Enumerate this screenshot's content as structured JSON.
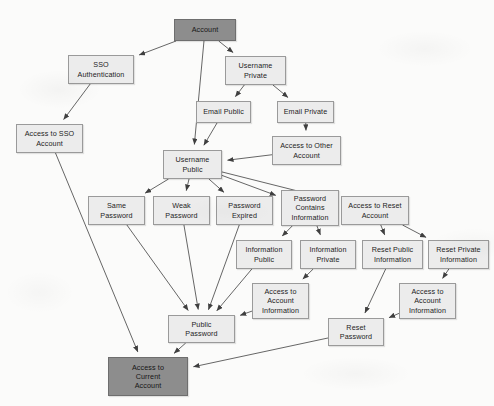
{
  "diagram": {
    "type": "attack-tree",
    "background_color": "#fbfbfa",
    "node_fill_light": "#ececec",
    "node_fill_dark": "#8d8d8d",
    "node_border_color": "#9a9a9a",
    "edge_color": "#4a4a4a",
    "nodes": [
      {
        "id": "account",
        "label": "Account",
        "shade": "dark",
        "x": 174,
        "y": 19,
        "w": 62,
        "h": 22
      },
      {
        "id": "sso_auth",
        "label": "SSO\nAuthentication",
        "shade": "light",
        "x": 68,
        "y": 55,
        "w": 66,
        "h": 29
      },
      {
        "id": "username_private",
        "label": "Username\nPrivate",
        "shade": "light",
        "x": 225,
        "y": 56,
        "w": 61,
        "h": 29
      },
      {
        "id": "email_public",
        "label": "Email Public",
        "shade": "light",
        "x": 196,
        "y": 101,
        "w": 55,
        "h": 22
      },
      {
        "id": "email_private",
        "label": "Email Private",
        "shade": "light",
        "x": 277,
        "y": 101,
        "w": 57,
        "h": 22
      },
      {
        "id": "access_sso",
        "label": "Access to SSO\nAccount",
        "shade": "light",
        "x": 16,
        "y": 124,
        "w": 67,
        "h": 29
      },
      {
        "id": "access_other",
        "label": "Access to Other\nAccount",
        "shade": "light",
        "x": 272,
        "y": 136,
        "w": 69,
        "h": 29
      },
      {
        "id": "username_public",
        "label": "Username\nPublic",
        "shade": "light",
        "x": 163,
        "y": 150,
        "w": 59,
        "h": 29
      },
      {
        "id": "same_password",
        "label": "Same\nPassword",
        "shade": "light",
        "x": 88,
        "y": 196,
        "w": 57,
        "h": 29
      },
      {
        "id": "weak_password",
        "label": "Weak\nPassword",
        "shade": "light",
        "x": 153,
        "y": 196,
        "w": 57,
        "h": 29
      },
      {
        "id": "password_expired",
        "label": "Password\nExpired",
        "shade": "light",
        "x": 216,
        "y": 196,
        "w": 57,
        "h": 29
      },
      {
        "id": "pwd_contains",
        "label": "Password\nContains\nInformation",
        "shade": "light",
        "x": 281,
        "y": 190,
        "w": 58,
        "h": 36
      },
      {
        "id": "access_reset",
        "label": "Access to Reset\nAccount",
        "shade": "light",
        "x": 341,
        "y": 196,
        "w": 68,
        "h": 29
      },
      {
        "id": "info_public",
        "label": "Information\nPublic",
        "shade": "light",
        "x": 236,
        "y": 240,
        "w": 56,
        "h": 29
      },
      {
        "id": "info_private",
        "label": "Information\nPrivate",
        "shade": "light",
        "x": 300,
        "y": 240,
        "w": 56,
        "h": 29
      },
      {
        "id": "reset_public",
        "label": "Reset Public\nInformation",
        "shade": "light",
        "x": 362,
        "y": 240,
        "w": 61,
        "h": 29
      },
      {
        "id": "reset_private",
        "label": "Reset Private\nInformation",
        "shade": "light",
        "x": 428,
        "y": 240,
        "w": 61,
        "h": 29
      },
      {
        "id": "access_acct_1",
        "label": "Access to\nAccount\nInformation",
        "shade": "light",
        "x": 252,
        "y": 283,
        "w": 57,
        "h": 36
      },
      {
        "id": "access_acct_2",
        "label": "Access to\nAccount\nInformation",
        "shade": "light",
        "x": 399,
        "y": 283,
        "w": 57,
        "h": 36
      },
      {
        "id": "public_password",
        "label": "Public\nPassword",
        "shade": "light",
        "x": 168,
        "y": 315,
        "w": 67,
        "h": 28
      },
      {
        "id": "reset_password",
        "label": "Reset\nPassword",
        "shade": "light",
        "x": 328,
        "y": 318,
        "w": 56,
        "h": 28
      },
      {
        "id": "access_current",
        "label": "Access to\nCurrent\nAccount",
        "shade": "dark",
        "x": 108,
        "y": 357,
        "w": 80,
        "h": 39
      }
    ],
    "edges": [
      {
        "from": "account",
        "to": "sso_auth"
      },
      {
        "from": "account",
        "to": "username_private"
      },
      {
        "from": "account",
        "to": "username_public"
      },
      {
        "from": "sso_auth",
        "to": "access_sso"
      },
      {
        "from": "username_private",
        "to": "email_public"
      },
      {
        "from": "username_private",
        "to": "email_private"
      },
      {
        "from": "email_public",
        "to": "username_public"
      },
      {
        "from": "email_private",
        "to": "access_other"
      },
      {
        "from": "access_other",
        "to": "username_public"
      },
      {
        "from": "access_sso",
        "to": "access_current"
      },
      {
        "from": "username_public",
        "to": "same_password"
      },
      {
        "from": "username_public",
        "to": "weak_password"
      },
      {
        "from": "username_public",
        "to": "password_expired"
      },
      {
        "from": "username_public",
        "to": "pwd_contains"
      },
      {
        "from": "username_public",
        "to": "access_reset"
      },
      {
        "from": "same_password",
        "to": "public_password"
      },
      {
        "from": "weak_password",
        "to": "public_password"
      },
      {
        "from": "password_expired",
        "to": "public_password"
      },
      {
        "from": "pwd_contains",
        "to": "info_public"
      },
      {
        "from": "pwd_contains",
        "to": "info_private"
      },
      {
        "from": "access_reset",
        "to": "reset_public"
      },
      {
        "from": "access_reset",
        "to": "reset_private"
      },
      {
        "from": "info_public",
        "to": "public_password"
      },
      {
        "from": "info_private",
        "to": "access_acct_1"
      },
      {
        "from": "access_acct_1",
        "to": "public_password"
      },
      {
        "from": "reset_public",
        "to": "reset_password"
      },
      {
        "from": "reset_private",
        "to": "access_acct_2"
      },
      {
        "from": "access_acct_2",
        "to": "reset_password"
      },
      {
        "from": "public_password",
        "to": "access_current"
      },
      {
        "from": "reset_password",
        "to": "access_current"
      }
    ]
  }
}
